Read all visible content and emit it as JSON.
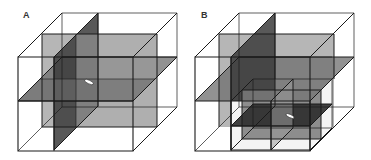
{
  "figure": {
    "panels": [
      {
        "label": "A",
        "description": "Cube divided by three orthogonal planes (frontal, sagittal, horizontal) with a white marker at the center"
      },
      {
        "label": "B",
        "description": "Same cube with an additional subdivided sub-cube in the lower-front-right octant containing the white marker"
      }
    ]
  },
  "colors": {
    "background": "#ffffff",
    "edge": "#1a1a1a",
    "frontal_plane": "#a9a9a9",
    "sagittal_plane": "#3c3c3c",
    "horizontal_plane": "#6e6e6e",
    "sub_frontal": "#7a7a7a",
    "sub_horizontal": "#2e2e2e",
    "marker": "#ffffff"
  }
}
